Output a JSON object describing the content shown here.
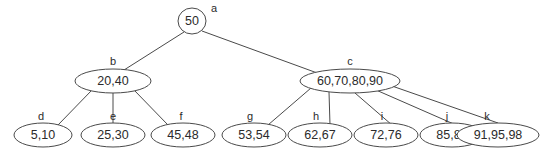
{
  "diagram": {
    "background_color": "#ffffff",
    "stroke_color": "#4a4a4a",
    "text_color": "#2b2b2b",
    "nodes": [
      {
        "id": "a",
        "label": "a",
        "value": "50",
        "shape": "circle",
        "cx": 192,
        "cy": 21,
        "rx": 14,
        "ry": 13,
        "label_x": 214,
        "label_y": 12
      },
      {
        "id": "b",
        "label": "b",
        "value": "20,40",
        "shape": "ellipse",
        "cx": 113,
        "cy": 81,
        "rx": 38,
        "ry": 12,
        "label_x": 113,
        "label_y": 65
      },
      {
        "id": "c",
        "label": "c",
        "value": "60,70,80,90",
        "shape": "ellipse",
        "cx": 350,
        "cy": 81,
        "rx": 50,
        "ry": 12,
        "label_x": 350,
        "label_y": 65
      },
      {
        "id": "d",
        "label": "d",
        "value": "5,10",
        "shape": "ellipse",
        "cx": 43,
        "cy": 135,
        "rx": 29,
        "ry": 12,
        "label_x": 41,
        "label_y": 120
      },
      {
        "id": "e",
        "label": "e",
        "value": "25,30",
        "shape": "ellipse",
        "cx": 113,
        "cy": 135,
        "rx": 32,
        "ry": 12,
        "label_x": 113,
        "label_y": 120
      },
      {
        "id": "f",
        "label": "f",
        "value": "45,48",
        "shape": "ellipse",
        "cx": 183,
        "cy": 135,
        "rx": 32,
        "ry": 12,
        "label_x": 181,
        "label_y": 120
      },
      {
        "id": "g",
        "label": "g",
        "value": "53,54",
        "shape": "ellipse",
        "cx": 254,
        "cy": 135,
        "rx": 32,
        "ry": 12,
        "label_x": 250,
        "label_y": 120
      },
      {
        "id": "h",
        "label": "h",
        "value": "62,67",
        "shape": "ellipse",
        "cx": 320,
        "cy": 135,
        "rx": 32,
        "ry": 12,
        "label_x": 316,
        "label_y": 120
      },
      {
        "id": "i",
        "label": "i",
        "value": "72,76",
        "shape": "ellipse",
        "cx": 386,
        "cy": 135,
        "rx": 32,
        "ry": 12,
        "label_x": 382,
        "label_y": 120
      },
      {
        "id": "j",
        "label": "j",
        "value": "85,88",
        "shape": "ellipse",
        "cx": 452,
        "cy": 135,
        "rx": 32,
        "ry": 12,
        "label_x": 447,
        "label_y": 120
      },
      {
        "id": "k",
        "label": "k",
        "value": "91,95,98",
        "shape": "ellipse",
        "cx": 498,
        "cy": 135,
        "rx": 41,
        "ry": 12,
        "label_x": 487,
        "label_y": 120
      }
    ],
    "edges": [
      {
        "from": "a",
        "to": "b",
        "x1": 184,
        "y1": 32,
        "x2": 124,
        "y2": 70
      },
      {
        "from": "a",
        "to": "c",
        "x1": 202,
        "y1": 31,
        "x2": 320,
        "y2": 74
      },
      {
        "from": "b",
        "to": "d",
        "x1": 92,
        "y1": 90,
        "x2": 58,
        "y2": 125
      },
      {
        "from": "b",
        "to": "e",
        "x1": 113,
        "y1": 93,
        "x2": 113,
        "y2": 123
      },
      {
        "from": "b",
        "to": "f",
        "x1": 134,
        "y1": 90,
        "x2": 168,
        "y2": 125
      },
      {
        "from": "c",
        "to": "g",
        "x1": 311,
        "y1": 88,
        "x2": 268,
        "y2": 125
      },
      {
        "from": "c",
        "to": "h",
        "x1": 329,
        "y1": 92,
        "x2": 330,
        "y2": 125
      },
      {
        "from": "c",
        "to": "i",
        "x1": 355,
        "y1": 93,
        "x2": 392,
        "y2": 125
      },
      {
        "from": "c",
        "to": "j",
        "x1": 376,
        "y1": 90,
        "x2": 456,
        "y2": 125
      },
      {
        "from": "c",
        "to": "k",
        "x1": 392,
        "y1": 86,
        "x2": 498,
        "y2": 123
      }
    ]
  }
}
